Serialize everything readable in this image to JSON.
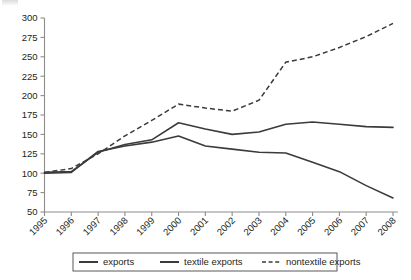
{
  "chart_data": {
    "type": "line",
    "title": "",
    "xlabel": "",
    "ylabel": "",
    "grid": false,
    "legend_position": "bottom",
    "categories": [
      "1995",
      "1996",
      "1997",
      "1998",
      "1999",
      "2000",
      "2001",
      "2002",
      "2003",
      "2004",
      "2005",
      "2006",
      "2007",
      "2008"
    ],
    "x": [
      1995,
      1996,
      1997,
      1998,
      1999,
      2000,
      2001,
      2002,
      2003,
      2004,
      2005,
      2006,
      2007,
      2008
    ],
    "xlim": [
      1995,
      2008
    ],
    "ylim": [
      50,
      300
    ],
    "yticks": [
      50,
      75,
      100,
      125,
      150,
      175,
      200,
      225,
      250,
      275,
      300
    ],
    "xticks": [
      "1995",
      "1996",
      "1997",
      "1998",
      "1999",
      "2000",
      "2001",
      "2002",
      "2003",
      "2004",
      "2005",
      "2006",
      "2007",
      "2008"
    ],
    "series": [
      {
        "name": "exports",
        "style": "solid",
        "color": "#3c3a3b",
        "values": [
          101,
          102,
          127,
          137,
          143,
          165,
          157,
          150,
          153,
          163,
          166,
          163,
          160,
          159
        ]
      },
      {
        "name": "textile exports",
        "style": "solid",
        "color": "#3c3a3b",
        "values": [
          100,
          101,
          128,
          135,
          140,
          148,
          135,
          131,
          127,
          126,
          114,
          102,
          84,
          68
        ]
      },
      {
        "name": "nontextile exports",
        "style": "dashed",
        "color": "#3c3a3b",
        "values": [
          101,
          106,
          125,
          148,
          168,
          189,
          184,
          180,
          194,
          243,
          250,
          262,
          276,
          293
        ]
      }
    ]
  },
  "legend": {
    "items": [
      {
        "label": "exports",
        "style": "solid"
      },
      {
        "label": "textile exports",
        "style": "solid"
      },
      {
        "label": "nontextile exports",
        "style": "dashed"
      }
    ]
  },
  "axes": {
    "y_tick_labels": [
      "300",
      "275",
      "250",
      "225",
      "200",
      "175",
      "150",
      "125",
      "100",
      "75",
      "50"
    ],
    "x_tick_labels": [
      "1995",
      "1996",
      "1997",
      "1998",
      "1999",
      "2000",
      "2001",
      "2002",
      "2003",
      "2004",
      "2005",
      "2006",
      "2007",
      "2008"
    ]
  }
}
